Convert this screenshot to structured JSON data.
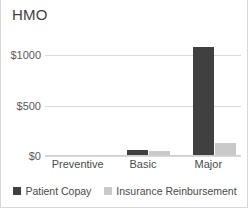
{
  "chart_data": {
    "type": "bar",
    "title": "HMO",
    "xlabel": "",
    "ylabel": "",
    "categories": [
      "Preventive",
      "Basic",
      "Major"
    ],
    "series": [
      {
        "name": "Patient Copay",
        "color": "#404040",
        "values": [
          0,
          45,
          1070
        ]
      },
      {
        "name": "Insurance Reinbursement",
        "color": "#c9c9c9",
        "values": [
          0,
          42,
          120
        ]
      }
    ],
    "ylim": [
      0,
      1250
    ],
    "yticks": [
      0,
      500,
      1000
    ],
    "ytick_labels": [
      "$0",
      "$500",
      "$1000"
    ],
    "grid": true,
    "legend_position": "bottom"
  },
  "legend": {
    "items": [
      {
        "label": "Patient Copay",
        "color": "#404040"
      },
      {
        "label": "Insurance Reinbursement",
        "color": "#c9c9c9"
      }
    ]
  }
}
